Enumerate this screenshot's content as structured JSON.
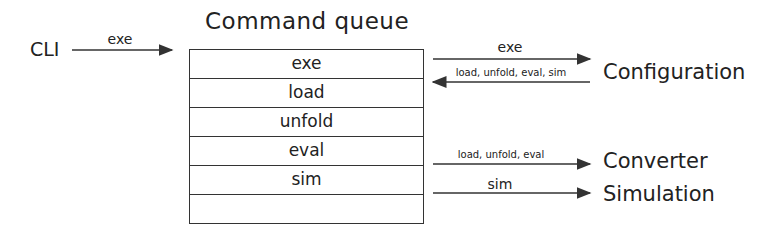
{
  "title": "Command queue",
  "source": "CLI",
  "source_arrow_label": "exe",
  "queue": [
    "exe",
    "load",
    "unfold",
    "eval",
    "sim",
    ""
  ],
  "targets": {
    "configuration": {
      "name": "Configuration",
      "out_label": "exe",
      "in_label": "load, unfold, eval, sim"
    },
    "converter": {
      "name": "Converter",
      "label": "load, unfold, eval"
    },
    "simulation": {
      "name": "Simulation",
      "label": "sim"
    }
  }
}
